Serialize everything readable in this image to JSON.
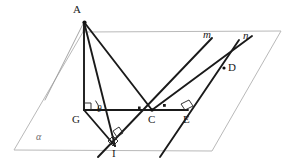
{
  "figure": {
    "type": "solid-geometry-diagram",
    "canvas": {
      "width": 291,
      "height": 167
    },
    "plane": {
      "name": "alpha",
      "label": "α",
      "label_position": {
        "x": 36,
        "y": 132
      },
      "corners": [
        {
          "x": 83,
          "y": 32
        },
        {
          "x": 281,
          "y": 31
        },
        {
          "x": 212,
          "y": 151
        },
        {
          "x": 14,
          "y": 150
        }
      ]
    },
    "points": [
      {
        "id": "A",
        "label": "A",
        "x": 84,
        "y": 22,
        "label_x": 73,
        "label_y": 5,
        "apex": true
      },
      {
        "id": "G",
        "label": "G",
        "x": 84,
        "y": 110,
        "label_x": 73,
        "label_y": 115
      },
      {
        "id": "C",
        "label": "C",
        "x": 152,
        "y": 110,
        "label_x": 148,
        "label_y": 115
      },
      {
        "id": "E",
        "label": "E",
        "x": 188,
        "y": 110,
        "label_x": 184,
        "label_y": 115
      },
      {
        "id": "I",
        "label": "I",
        "x": 115,
        "y": 146,
        "label_x": 112,
        "label_y": 149
      },
      {
        "id": "D",
        "label": "D",
        "x": 224,
        "y": 68,
        "label_x": 229,
        "label_y": 63
      }
    ],
    "lines": [
      {
        "id": "m",
        "label": "m",
        "label_x": 203,
        "label_y": 30
      },
      {
        "id": "n",
        "label": "n",
        "label_x": 243,
        "label_y": 31
      }
    ],
    "angles": [
      {
        "id": "theta",
        "label": "θ",
        "vertex": "G",
        "label_x": 98,
        "label_y": 111
      }
    ],
    "segments": [
      {
        "from": "A",
        "to": "G",
        "style": "solid"
      },
      {
        "from": "A",
        "to": "C",
        "style": "solid"
      },
      {
        "from": "A",
        "to": "I",
        "style": "solid"
      },
      {
        "from": "G",
        "to": "C",
        "style": "solid"
      },
      {
        "from": "C",
        "to": "E",
        "style": "solid"
      },
      {
        "from": "G",
        "to": "I",
        "style": "solid"
      },
      {
        "from": "C",
        "to": "I",
        "style": "solid"
      }
    ],
    "right_angles": [
      {
        "at": "G",
        "between": [
          "AG",
          "GC"
        ]
      },
      {
        "at": "I",
        "between": [
          "GI",
          "line-m"
        ]
      },
      {
        "at": "I",
        "between": [
          "AI",
          "line-m"
        ]
      },
      {
        "at": "C",
        "between": [
          "GC",
          "line-m"
        ]
      },
      {
        "at": "C",
        "between": [
          "CE",
          "line-n"
        ]
      },
      {
        "at": "E",
        "between": [
          "CE",
          "line-n"
        ]
      }
    ]
  }
}
